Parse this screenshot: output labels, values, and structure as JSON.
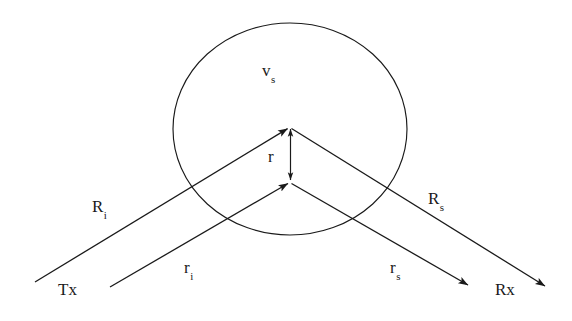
{
  "figure": {
    "type": "scattering-geometry-diagram",
    "background_color": "#ffffff",
    "stroke_color": "#1a1a1a",
    "canvas": {
      "width": 572,
      "height": 321
    }
  },
  "labels": {
    "volume": {
      "base": "v",
      "sub": "s",
      "x": 262,
      "y": 62
    },
    "radius": {
      "base": "r",
      "sub": "",
      "x": 268,
      "y": 148
    },
    "incident_range": {
      "base": "R",
      "sub": "i",
      "x": 92,
      "y": 198
    },
    "scattered_range": {
      "base": "R",
      "sub": "s",
      "x": 428,
      "y": 190
    },
    "incident_ray": {
      "base": "r",
      "sub": "i",
      "x": 184,
      "y": 259
    },
    "scattered_ray": {
      "base": "r",
      "sub": "s",
      "x": 390,
      "y": 259
    },
    "transmitter": {
      "base": "Tx",
      "sub": "",
      "x": 58,
      "y": 281
    },
    "receiver": {
      "base": "Rx",
      "sub": "",
      "x": 495,
      "y": 281
    }
  },
  "geometry": {
    "circle": {
      "cx": 290,
      "cy": 129,
      "rx": 117,
      "ry": 106
    },
    "upper_vertex": {
      "x": 290,
      "y": 127
    },
    "lower_vertex": {
      "x": 290,
      "y": 182
    },
    "R_i_line": {
      "x1": 35,
      "y1": 282,
      "x2": 290,
      "y2": 127
    },
    "R_s_line": {
      "x1": 290,
      "y1": 127,
      "x2": 545,
      "y2": 286
    },
    "r_i_line": {
      "x1": 110,
      "y1": 287,
      "x2": 290,
      "y2": 182
    },
    "r_s_line": {
      "x1": 290,
      "y1": 182,
      "x2": 468,
      "y2": 285
    },
    "r_arrow": {
      "x1": 290,
      "y1": 127,
      "x2": 290,
      "y2": 182,
      "double_headed": true
    }
  }
}
